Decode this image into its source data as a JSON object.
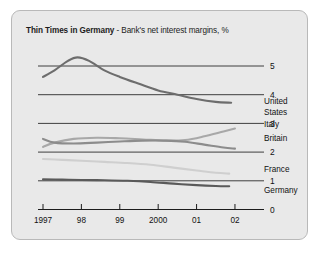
{
  "title": {
    "strong": "Thin Times in Germany",
    "rest": " - Bank's net interest margins, %"
  },
  "chart_data": {
    "type": "line",
    "title": "Thin Times in Germany - Bank's net interest margins, %",
    "xlabel": "",
    "ylabel": "%",
    "xlim": [
      1997,
      2002.6
    ],
    "ylim": [
      0,
      5.6
    ],
    "grid": true,
    "gridlines": [
      1,
      2,
      3,
      4,
      5
    ],
    "legend_position": "right-inline",
    "categories": [
      "1997",
      "98",
      "99",
      "2000",
      "01",
      "02"
    ],
    "x": [
      1997,
      1998,
      1999,
      2000,
      2001,
      2002
    ],
    "series": [
      {
        "name": "United States",
        "label": "United States",
        "color": "#6d6d6d",
        "x": [
          1997.0,
          1997.3,
          1997.65,
          1997.9,
          1998.2,
          1998.6,
          1999.0,
          1999.5,
          2000.0,
          2000.5,
          2001.0,
          2001.5,
          2001.9
        ],
        "values": [
          4.62,
          4.85,
          5.18,
          5.3,
          5.18,
          4.85,
          4.62,
          4.38,
          4.15,
          4.0,
          3.85,
          3.75,
          3.72
        ]
      },
      {
        "name": "Italy",
        "label": "Italy",
        "color": "#a8a8a8",
        "x": [
          1997.0,
          1997.3,
          1997.8,
          1998.4,
          1999.0,
          1999.6,
          2000.2,
          2000.7,
          2001.2,
          2001.7,
          2002.0
        ],
        "values": [
          2.18,
          2.33,
          2.46,
          2.5,
          2.48,
          2.44,
          2.4,
          2.42,
          2.55,
          2.72,
          2.82
        ]
      },
      {
        "name": "Britain",
        "label": "Britain",
        "color": "#8c8c8c",
        "x": [
          1997.0,
          1997.3,
          1997.8,
          1998.4,
          1999.0,
          1999.6,
          2000.2,
          2000.7,
          2001.2,
          2001.7,
          2002.0
        ],
        "values": [
          2.46,
          2.33,
          2.3,
          2.33,
          2.37,
          2.4,
          2.4,
          2.36,
          2.26,
          2.16,
          2.12
        ]
      },
      {
        "name": "France",
        "label": "France",
        "color": "#cfcfcf",
        "x": [
          1997.0,
          1997.5,
          1998.0,
          1998.6,
          1999.2,
          1999.8,
          2000.4,
          2001.0,
          2001.5,
          2001.85
        ],
        "values": [
          1.76,
          1.73,
          1.7,
          1.66,
          1.62,
          1.56,
          1.46,
          1.36,
          1.28,
          1.25
        ]
      },
      {
        "name": "Germany",
        "label": "Germany",
        "color": "#5a5a5a",
        "x": [
          1997.0,
          1997.5,
          1998.0,
          1998.6,
          1999.2,
          1999.8,
          2000.4,
          2001.0,
          2001.5,
          2001.85
        ],
        "values": [
          1.05,
          1.04,
          1.03,
          1.02,
          1.0,
          0.96,
          0.9,
          0.85,
          0.82,
          0.81
        ]
      }
    ]
  },
  "axes": {
    "y_ticks": [
      "0",
      "1",
      "2",
      "3",
      "4",
      "5"
    ],
    "x_ticks": [
      "1997",
      "98",
      "99",
      "2000",
      "01",
      "02"
    ]
  },
  "colors": {
    "panel_background": "#e9e9e9",
    "panel_border": "#b9b9b9",
    "axis": "#1c1c1c",
    "gridline": "#2b2b2b"
  }
}
